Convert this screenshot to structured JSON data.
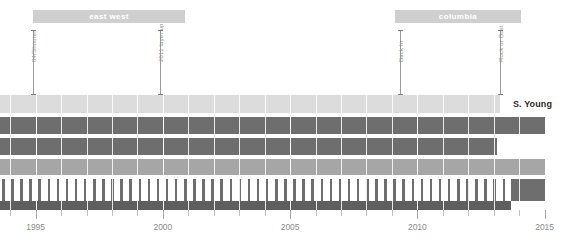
{
  "chart_data": {
    "type": "bar",
    "title": "",
    "xlabel": "",
    "ylabel": "",
    "orientation": "horizontal",
    "xlim": [
      1993.6,
      2015.8
    ],
    "grid": true,
    "legend_position": "none",
    "axis_ticks_major": [
      1995,
      2000,
      2005,
      2010,
      2015
    ],
    "axis_tick_labels": [
      "1995",
      "2000",
      "2005",
      "2010",
      "2015"
    ],
    "axis_minor_interval": 1,
    "groups": [
      {
        "label": "east west",
        "start": 1994.9,
        "end": 2001.0
      },
      {
        "label": "columbia",
        "start": 2009.4,
        "end": 2014.4
      }
    ],
    "annotations": [
      {
        "label": "84/Shooter",
        "x": 1994.9
      },
      {
        "label": "2011 layer up",
        "x": 1999.9
      },
      {
        "label": "Back In",
        "x": 2009.5
      },
      {
        "label": "Rock or Bust",
        "x": 2013.5
      }
    ],
    "series": [
      {
        "name": "row-1",
        "start": 1993.6,
        "end": 2015.5,
        "value": 21.9,
        "style": "solid",
        "color": "#dcdcdc"
      },
      {
        "name": "row-2",
        "start": 1993.6,
        "end": 2014.5,
        "value": 20.9,
        "style": "solid",
        "color": "#6e6e6e"
      },
      {
        "name": "row-3",
        "start": 1993.6,
        "end": 2012.0,
        "value": 18.4,
        "style": "solid",
        "color": "#6e6e6e"
      },
      {
        "name": "row-4",
        "start": 1993.6,
        "end": 2015.5,
        "value": 21.9,
        "style": "solid",
        "color": "#a6a6a6"
      },
      {
        "name": "row-5",
        "start": 1993.6,
        "end": 2013.6,
        "value": 20.0,
        "style": "striped",
        "color": "#6e6e6e"
      },
      {
        "name": "row-5-tail",
        "start": 2013.6,
        "end": 2015.5,
        "value": 1.9,
        "style": "solid",
        "color": "#6e6e6e"
      },
      {
        "name": "row-6",
        "start": 1993.6,
        "end": 2013.6,
        "value": 20.0,
        "style": "solid",
        "color": "#5e5e5e"
      }
    ]
  },
  "labels": {
    "artist_name": "S. Young"
  },
  "colors": {
    "group_bar": "#cfcfcf",
    "row_light": "#dcdcdc",
    "row_mid": "#a6a6a6",
    "row_dark": "#6e6e6e",
    "row_darkest": "#5e5e5e",
    "annotation_line": "#9a9a9a",
    "axis_text": "#8c8c8c",
    "name_text": "#2b2b2b",
    "background": "#ffffff"
  }
}
